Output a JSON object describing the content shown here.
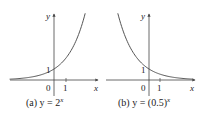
{
  "chart_data": [
    {
      "type": "line",
      "title": "(a) y = 2^x",
      "caption_prefix": "(a) y = 2",
      "caption_exponent": "x",
      "function": "2^x",
      "xlabel": "x",
      "ylabel": "y",
      "tick_labels": {
        "origin": "0",
        "x_tick": "1",
        "y_tick": "1"
      },
      "x": [
        -3.5,
        -3,
        -2,
        -1,
        0,
        1,
        2,
        2.6
      ],
      "values": [
        0.088,
        0.125,
        0.25,
        0.5,
        1,
        2,
        4,
        6.06
      ],
      "y_intercept": 1,
      "grid": false,
      "curve_color": "#555555",
      "axis_color": "#444444"
    },
    {
      "type": "line",
      "title": "(b) y = (0.5)^x",
      "caption_prefix": "(b) y = (0.5)",
      "caption_exponent": "x",
      "function": "(0.5)^x",
      "xlabel": "x",
      "ylabel": "y",
      "tick_labels": {
        "origin": "0",
        "x_tick": "1",
        "y_tick": "1"
      },
      "x": [
        -2.6,
        -2,
        -1,
        0,
        1,
        2,
        3,
        3.5
      ],
      "values": [
        6.06,
        4,
        2,
        1,
        0.5,
        0.25,
        0.125,
        0.088
      ],
      "y_intercept": 1,
      "grid": false,
      "curve_color": "#555555",
      "axis_color": "#444444"
    }
  ]
}
